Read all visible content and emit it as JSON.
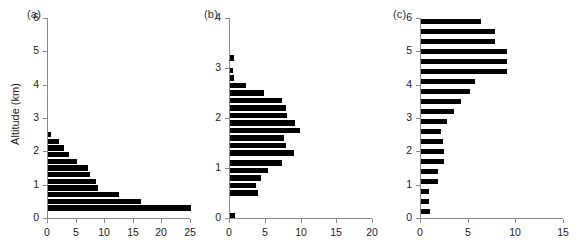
{
  "figure": {
    "ylabel": "Altitude (km)",
    "bar_color": "#000000",
    "axis_color": "#8a8a8a"
  },
  "chart_data": [
    {
      "type": "bar",
      "orientation": "horizontal",
      "title": "(a)",
      "xlabel": "",
      "ylabel": "Altitude (km)",
      "xlim": [
        0,
        25
      ],
      "ylim": [
        0,
        6
      ],
      "xticks": [
        0,
        5,
        10,
        15,
        20,
        25
      ],
      "yticks": [
        0,
        1,
        2,
        3,
        4,
        5,
        6
      ],
      "grid": false,
      "bin_width": 0.2,
      "categories": [
        0.3,
        0.5,
        0.7,
        0.9,
        1.1,
        1.3,
        1.5,
        1.7,
        1.9,
        2.1,
        2.3,
        2.5,
        2.7,
        2.9
      ],
      "values": [
        25.0,
        16.3,
        12.4,
        8.8,
        8.4,
        7.3,
        7.0,
        5.0,
        3.6,
        2.8,
        2.0,
        0.6,
        0.0,
        0.0
      ]
    },
    {
      "type": "bar",
      "orientation": "horizontal",
      "title": "(b)",
      "xlabel": "",
      "ylabel": "",
      "xlim": [
        0,
        20
      ],
      "ylim": [
        0,
        4
      ],
      "xticks": [
        0,
        5,
        10,
        15,
        20
      ],
      "yticks": [
        0,
        1,
        2,
        3,
        4
      ],
      "grid": false,
      "bin_width": 0.15,
      "categories": [
        0.05,
        0.5,
        0.65,
        0.8,
        0.95,
        1.1,
        1.3,
        1.45,
        1.6,
        1.75,
        1.9,
        2.05,
        2.2,
        2.35,
        2.5,
        2.65,
        2.8,
        2.95,
        3.2,
        3.5,
        3.7,
        3.85
      ],
      "values": [
        0.7,
        3.9,
        3.6,
        4.4,
        5.3,
        7.3,
        9.0,
        7.8,
        7.5,
        9.8,
        9.1,
        8.0,
        7.8,
        7.3,
        4.7,
        2.3,
        0.5,
        0.4,
        0.5,
        0.0,
        0.0,
        0.0
      ]
    },
    {
      "type": "bar",
      "orientation": "horizontal",
      "title": "(c)",
      "xlabel": "",
      "ylabel": "",
      "xlim": [
        0,
        15
      ],
      "ylim": [
        0,
        6
      ],
      "xticks": [
        0,
        5,
        10,
        15
      ],
      "yticks": [
        0,
        1,
        2,
        3,
        4,
        5,
        6
      ],
      "grid": false,
      "bin_width": 0.2,
      "categories": [
        0.2,
        0.5,
        0.8,
        1.1,
        1.4,
        1.7,
        2.0,
        2.3,
        2.6,
        2.9,
        3.2,
        3.5,
        3.8,
        4.1,
        4.4,
        4.7,
        5.0,
        5.3,
        5.6,
        5.9
      ],
      "values": [
        0.9,
        0.8,
        0.8,
        1.8,
        1.8,
        2.4,
        2.4,
        2.3,
        2.1,
        2.7,
        3.5,
        4.2,
        5.1,
        5.7,
        9.0,
        9.0,
        9.0,
        7.8,
        7.8,
        6.3
      ]
    }
  ],
  "panels": {
    "a": {
      "label": "(a)",
      "ytick_labels": [
        "0",
        "1",
        "2",
        "3",
        "4",
        "5",
        "6"
      ],
      "xtick_labels": [
        "0",
        "5",
        "10",
        "15",
        "20",
        "25"
      ]
    },
    "b": {
      "label": "(b)",
      "ytick_labels": [
        "0",
        "1",
        "2",
        "3",
        "4"
      ],
      "xtick_labels": [
        "0",
        "5",
        "10",
        "15",
        "20"
      ]
    },
    "c": {
      "label": "(c)",
      "ytick_labels": [
        "0",
        "1",
        "2",
        "3",
        "4",
        "5",
        "6"
      ],
      "xtick_labels": [
        "0",
        "5",
        "10",
        "15"
      ]
    }
  }
}
